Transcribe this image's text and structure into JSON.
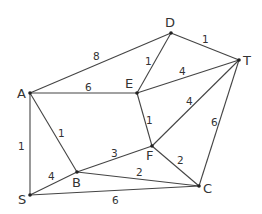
{
  "title": "",
  "graph": {
    "line_color": "#444444",
    "nodes": [
      {
        "id": "A",
        "label": "A",
        "x": 30,
        "y": 93,
        "lx": 17,
        "ly": 98
      },
      {
        "id": "D",
        "label": "D",
        "x": 171,
        "y": 33,
        "lx": 165,
        "ly": 27
      },
      {
        "id": "T",
        "label": "T",
        "x": 239,
        "y": 60,
        "lx": 243,
        "ly": 65
      },
      {
        "id": "E",
        "label": "E",
        "x": 137,
        "y": 93,
        "lx": 125,
        "ly": 88
      },
      {
        "id": "F",
        "label": "F",
        "x": 152,
        "y": 146,
        "lx": 146,
        "ly": 160
      },
      {
        "id": "B",
        "label": "B",
        "x": 77,
        "y": 172,
        "lx": 72,
        "ly": 187
      },
      {
        "id": "S",
        "label": "S",
        "x": 30,
        "y": 195,
        "lx": 18,
        "ly": 204
      },
      {
        "id": "C",
        "label": "C",
        "x": 199,
        "y": 186,
        "lx": 203,
        "ly": 193
      }
    ],
    "edges": [
      {
        "from": "A",
        "to": "D",
        "weight": "8",
        "lx": 93,
        "ly": 60
      },
      {
        "from": "A",
        "to": "E",
        "weight": "6",
        "lx": 85,
        "ly": 91
      },
      {
        "from": "A",
        "to": "S",
        "weight": "1",
        "lx": 18,
        "ly": 150
      },
      {
        "from": "A",
        "to": "B",
        "weight": "1",
        "lx": 58,
        "ly": 137
      },
      {
        "from": "D",
        "to": "E",
        "weight": "1",
        "lx": 145,
        "ly": 65
      },
      {
        "from": "D",
        "to": "T",
        "weight": "1",
        "lx": 202,
        "ly": 43
      },
      {
        "from": "E",
        "to": "T",
        "weight": "4",
        "lx": 179,
        "ly": 75
      },
      {
        "from": "E",
        "to": "F",
        "weight": "1",
        "lx": 146,
        "ly": 124
      },
      {
        "from": "F",
        "to": "T",
        "weight": "4",
        "lx": 186,
        "ly": 105
      },
      {
        "from": "T",
        "to": "C",
        "weight": "6",
        "lx": 211,
        "ly": 126
      },
      {
        "from": "B",
        "to": "F",
        "weight": "3",
        "lx": 111,
        "ly": 157
      },
      {
        "from": "F",
        "to": "C",
        "weight": "2",
        "lx": 177,
        "ly": 164
      },
      {
        "from": "B",
        "to": "C",
        "weight": "2",
        "lx": 136,
        "ly": 176
      },
      {
        "from": "S",
        "to": "B",
        "weight": "4",
        "lx": 48,
        "ly": 180
      },
      {
        "from": "S",
        "to": "C",
        "weight": "6",
        "lx": 112,
        "ly": 204
      }
    ]
  }
}
